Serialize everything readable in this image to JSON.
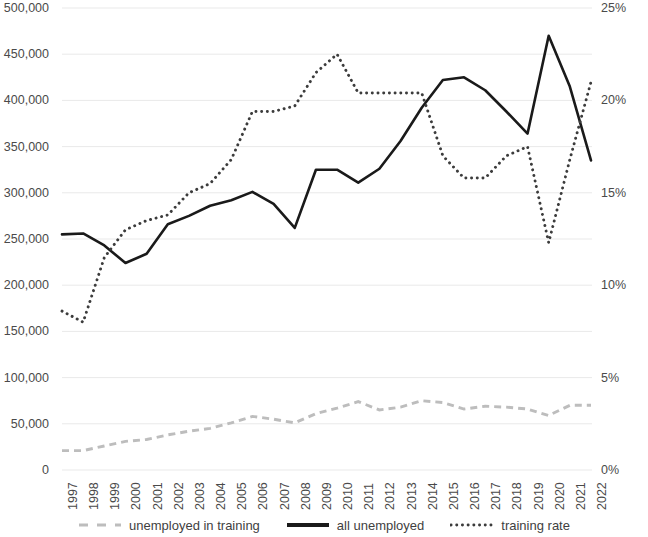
{
  "chart_data": {
    "type": "line",
    "title": "",
    "subtitle": "",
    "xlabel": "",
    "ylabel": "",
    "y2label": "",
    "grid": true,
    "legend_position": "bottom",
    "categories": [
      "1997",
      "1998",
      "1999",
      "2000",
      "2001",
      "2002",
      "2003",
      "2004",
      "2005",
      "2006",
      "2007",
      "2008",
      "2009",
      "2010",
      "2011",
      "2012",
      "2013",
      "2014",
      "2015",
      "2016",
      "2017",
      "2018",
      "2019",
      "2020",
      "2021",
      "2022"
    ],
    "left_axis": {
      "ticks": [
        "0",
        "50,000",
        "100,000",
        "150,000",
        "200,000",
        "250,000",
        "300,000",
        "350,000",
        "400,000",
        "450,000",
        "500,000"
      ],
      "tick_values": [
        0,
        50000,
        100000,
        150000,
        200000,
        250000,
        300000,
        350000,
        400000,
        450000,
        500000
      ],
      "ylim": [
        0,
        500000
      ]
    },
    "right_axis": {
      "ticks": [
        "0%",
        "5%",
        "10%",
        "15%",
        "20%",
        "25%"
      ],
      "tick_values": [
        0,
        5,
        10,
        15,
        20,
        25
      ],
      "ylim": [
        0,
        25
      ]
    },
    "series": [
      {
        "name": "unemployed in training",
        "axis": "left",
        "style": "dashed",
        "color": "#bdbdbd",
        "values": [
          21000,
          21000,
          26000,
          31000,
          33000,
          38000,
          42000,
          45000,
          51000,
          58000,
          55000,
          51000,
          61000,
          67000,
          74000,
          65000,
          68000,
          75000,
          73000,
          66000,
          69000,
          68000,
          66000,
          59000,
          70000,
          70000
        ]
      },
      {
        "name": "all unemployed",
        "axis": "left",
        "style": "solid",
        "color": "#1a1a1a",
        "values": [
          255000,
          256000,
          243000,
          224000,
          234000,
          266000,
          275000,
          286000,
          292000,
          301000,
          288000,
          262000,
          325000,
          325000,
          311000,
          326000,
          356000,
          392000,
          422000,
          425000,
          411000,
          388000,
          364000,
          470000,
          415000,
          335000
        ]
      },
      {
        "name": "training rate",
        "axis": "right",
        "style": "dotted",
        "color": "#3c3c3c",
        "values": [
          8.6,
          8.0,
          11.5,
          13.0,
          13.5,
          13.8,
          15.0,
          15.5,
          16.8,
          19.4,
          19.4,
          19.7,
          21.5,
          22.5,
          20.4,
          20.4,
          20.4,
          20.4,
          17.0,
          15.8,
          15.8,
          17.0,
          17.5,
          12.3,
          16.8,
          21.0
        ]
      }
    ]
  },
  "legend": {
    "items": [
      {
        "label": "unemployed in training",
        "style": "dashed",
        "color": "#bdbdbd"
      },
      {
        "label": "all unemployed",
        "style": "solid",
        "color": "#1a1a1a"
      },
      {
        "label": "training rate",
        "style": "dotted",
        "color": "#3c3c3c"
      }
    ]
  }
}
